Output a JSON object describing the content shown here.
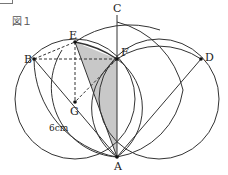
{
  "figure": {
    "title": "図１",
    "points": {
      "A": "A",
      "B": "B",
      "C": "C",
      "D": "D",
      "E": "E",
      "F": "F",
      "G": "G"
    },
    "measure": "6cm",
    "shade_color": "#c8c8c8",
    "line_color": "#333333"
  }
}
